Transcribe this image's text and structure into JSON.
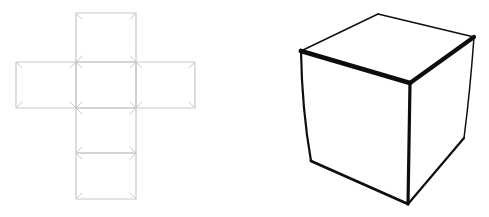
{
  "figure": {
    "background_color": "#ffffff",
    "net": {
      "label": "unfolded-cube-net",
      "stroke_color": "#c7c7c7",
      "tick_color": "#cbcbcb",
      "stroke_width": 1.2,
      "tick_inset": 6,
      "squares": [
        {
          "x": 76,
          "y": 13,
          "w": 60,
          "h": 49
        },
        {
          "x": 16,
          "y": 62,
          "w": 60,
          "h": 46
        },
        {
          "x": 76,
          "y": 62,
          "w": 60,
          "h": 46
        },
        {
          "x": 136,
          "y": 62,
          "w": 59,
          "h": 46
        },
        {
          "x": 76,
          "y": 108,
          "w": 60,
          "h": 45
        },
        {
          "x": 76,
          "y": 153,
          "w": 60,
          "h": 46
        }
      ]
    },
    "cube": {
      "label": "solid-cube-3d",
      "stroke_color": "#101010",
      "fill_color": "#ffffff",
      "blur": 0.55,
      "vertices": {
        "back_top": [
          378,
          14
        ],
        "top_left": [
          301,
          51
        ],
        "top_right": [
          474,
          37
        ],
        "front_top": [
          410,
          83
        ],
        "bottom_left": [
          311,
          161
        ],
        "front_bottom": [
          408,
          204
        ],
        "bottom_right": [
          464,
          138
        ]
      },
      "edges": [
        {
          "name": "back-top-left-edge",
          "d": "M 301 51 L 378 14",
          "w": 1.4
        },
        {
          "name": "back-top-right-edge",
          "d": "M 378 14 L 474 37",
          "w": 1.6
        },
        {
          "name": "front-top-left-edge",
          "d": "M 301 51 L 410 83",
          "w": 4.8
        },
        {
          "name": "front-top-right-edge",
          "d": "M 410 83 L 474 37",
          "w": 4.2
        },
        {
          "name": "left-vertical-edge",
          "d": "M 301 51 Q 302 110 311 161",
          "w": 2.2
        },
        {
          "name": "front-vertical-edge",
          "d": "M 410 83 L 408 204",
          "w": 3.2
        },
        {
          "name": "right-vertical-edge",
          "d": "M 474 37 Q 470 92 464 138",
          "w": 1.5
        },
        {
          "name": "bottom-left-edge",
          "d": "M 311 161 L 408 204",
          "w": 2.8
        },
        {
          "name": "bottom-right-edge",
          "d": "M 408 204 L 464 138",
          "w": 2.2
        }
      ]
    }
  }
}
